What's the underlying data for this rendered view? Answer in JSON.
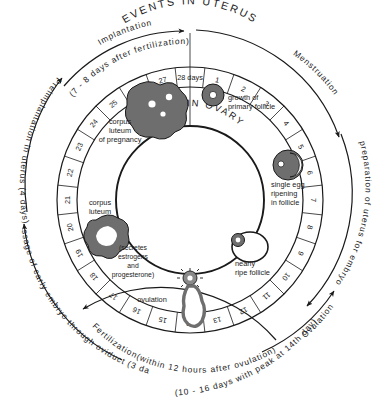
{
  "figure": {
    "title_uterus": "EVENTS IN UTERUS",
    "title_ovary": "EVENTS IN OVARY",
    "cycle_length_label": "28 days",
    "ink_color": "#1a1a1a",
    "background_color": "#ffffff"
  },
  "chart_data": {
    "type": "pie",
    "subtitle": "28 day menstrual cycle wheel",
    "categories": [
      "1",
      "2",
      "3",
      "4",
      "5",
      "6",
      "7",
      "8",
      "9",
      "10",
      "11",
      "12",
      "13",
      "14",
      "15",
      "16",
      "17",
      "18",
      "19",
      "20",
      "21",
      "22",
      "23",
      "24",
      "25",
      "26",
      "27",
      "28 days"
    ],
    "values": [
      1,
      1,
      1,
      1,
      1,
      1,
      1,
      1,
      1,
      1,
      1,
      1,
      1,
      1,
      1,
      1,
      1,
      1,
      1,
      1,
      1,
      1,
      1,
      1,
      1,
      1,
      1,
      1
    ],
    "xlabel": "day of cycle",
    "ylabel": "",
    "legend_position": "none",
    "grid": false
  },
  "day_ring": {
    "days": [
      "28 days",
      "1",
      "2",
      "3",
      "4",
      "5",
      "6",
      "7",
      "8",
      "9",
      "10",
      "11",
      "12",
      "13",
      "14",
      "15",
      "16",
      "17",
      "18",
      "19",
      "20",
      "21",
      "22",
      "23",
      "24",
      "25",
      "26",
      "27"
    ]
  },
  "outer_arcs": [
    {
      "name": "menstruation",
      "label": "Menstruation",
      "position": "top-right"
    },
    {
      "name": "preparation-of-uterus",
      "label": "preparation of uterus for embryo",
      "position": "right"
    },
    {
      "name": "ovulation",
      "label": "Ovulation",
      "position": "bottom-right"
    },
    {
      "name": "ovulation-detail",
      "label": "(10 - 16 days with peak at 14th day)",
      "position": "bottom-right-outer"
    },
    {
      "name": "fertilization",
      "label": "Fertilization(within 12 hours after ovulation)",
      "position": "bottom"
    },
    {
      "name": "passage-of-early-embryo",
      "label": "passage of early embryo through oviduct (3 days)",
      "position": "bottom-left"
    },
    {
      "name": "preimplantation",
      "label": "Preimplantation in uterus (4 days)",
      "position": "left"
    },
    {
      "name": "implantation",
      "label": "Implantation",
      "position": "top-left"
    },
    {
      "name": "implantation-detail",
      "label": "(7 - 8 days after fertilization)",
      "position": "top-left-inner"
    }
  ],
  "ovary_structures": [
    {
      "name": "corpus-luteum-of-pregnancy",
      "lines": [
        "corpus",
        "luteum",
        "of pregnancy"
      ]
    },
    {
      "name": "growth-of-primary-follicle",
      "lines": [
        "growth of",
        "primary follicle"
      ]
    },
    {
      "name": "single-egg-ripening",
      "lines": [
        "single egg",
        "ripening",
        "in follicle"
      ]
    },
    {
      "name": "nearly-ripe-follicle",
      "lines": [
        "nearly",
        "ripe follicle"
      ]
    },
    {
      "name": "ovulation-event",
      "lines": [
        "ovulation"
      ]
    },
    {
      "name": "corpus-luteum",
      "lines": [
        "corpus",
        "luteum"
      ]
    },
    {
      "name": "corpus-luteum-secretion",
      "lines": [
        "(secretes",
        "estrogens",
        "and",
        "progesterone)"
      ]
    }
  ]
}
